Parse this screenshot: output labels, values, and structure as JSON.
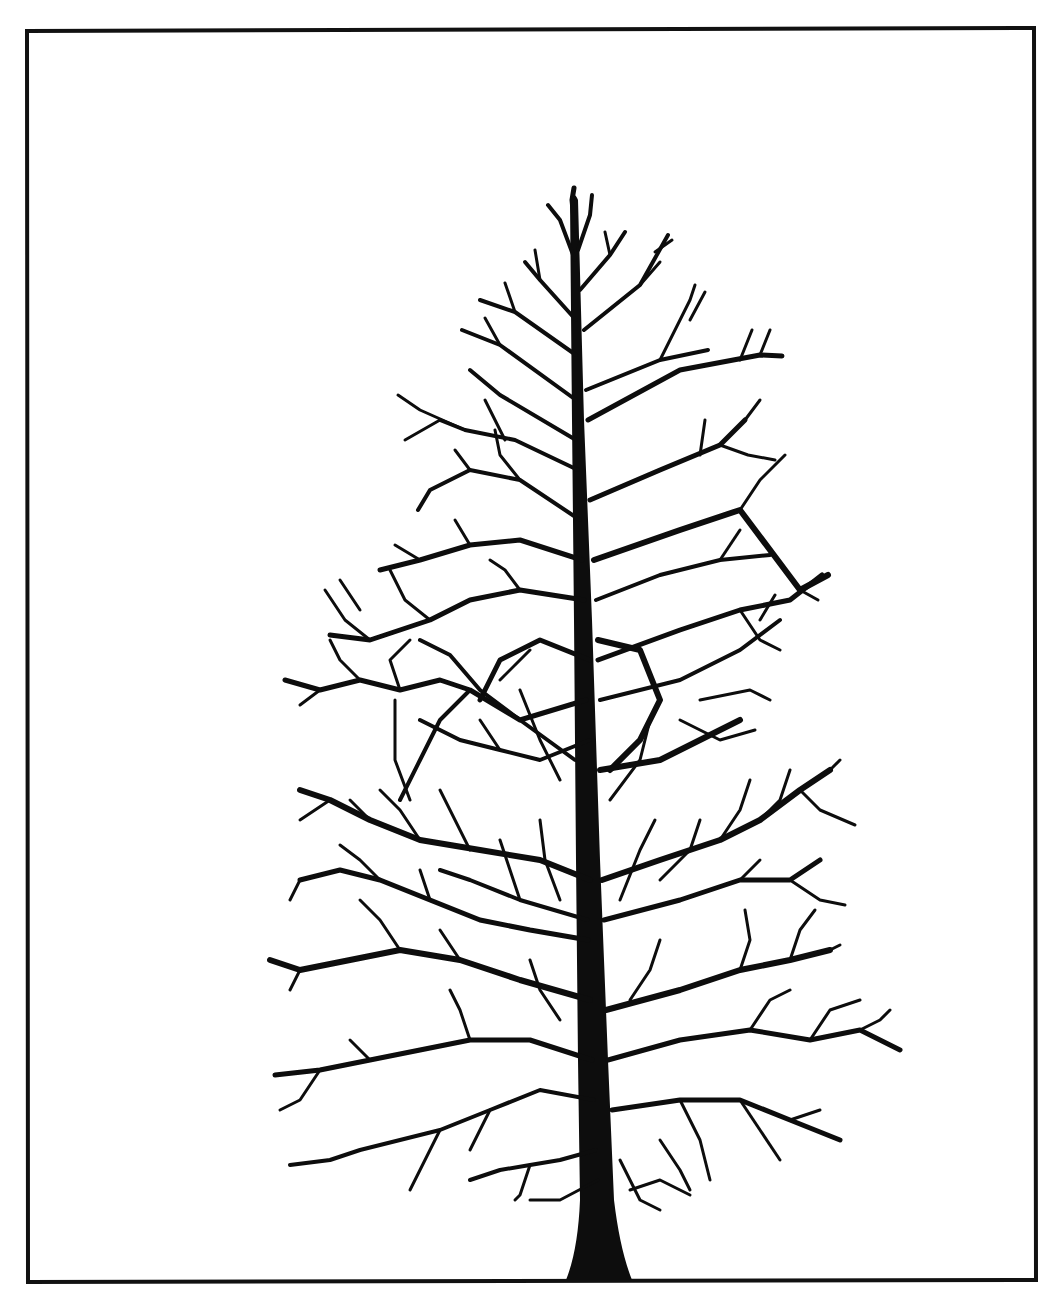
{
  "image": {
    "subject": "bare deciduous tree silhouette",
    "style": "black ink illustration on white",
    "colors": {
      "background": "#ffffff",
      "ink": "#0d0d0d",
      "frame": "#111111"
    },
    "frame": {
      "x": 26,
      "y": 30,
      "width": 1010,
      "height": 1252
    },
    "tree": {
      "apex": [
        573,
        188
      ],
      "trunk_base_center": [
        600,
        1280
      ],
      "crown_extent": {
        "left": 268,
        "right": 902,
        "top": 188,
        "bottom": 1210
      }
    }
  }
}
